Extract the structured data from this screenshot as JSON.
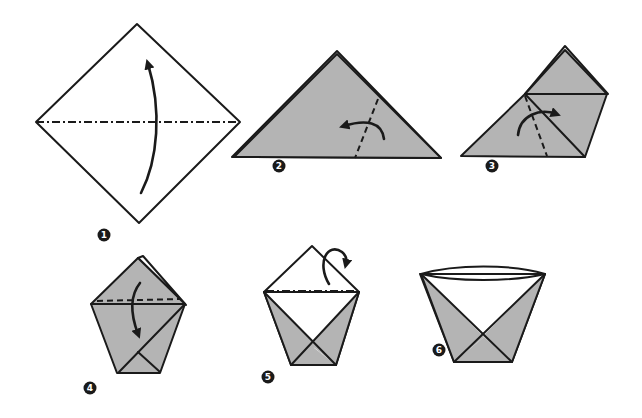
{
  "colors": {
    "paper_gray": "#b4b4b4",
    "paper_white": "#ffffff",
    "line": "#1a1a1a"
  },
  "steps": [
    {
      "number": "1",
      "description": "Fold square in half along the diagonal, bottom corner up",
      "fold": "valley",
      "arrow": "up"
    },
    {
      "number": "2",
      "description": "Fold the right corner across to the left",
      "fold": "valley",
      "arrow": "left"
    },
    {
      "number": "3",
      "description": "Fold the left corner across to the right",
      "fold": "valley",
      "arrow": "right"
    },
    {
      "number": "4",
      "description": "Fold the front top flap down",
      "fold": "valley",
      "arrow": "down"
    },
    {
      "number": "5",
      "description": "Fold the back top flap behind",
      "fold": "mountain",
      "arrow": "behind"
    },
    {
      "number": "6",
      "description": "Open the finished cup",
      "fold": "none",
      "arrow": "none"
    }
  ]
}
